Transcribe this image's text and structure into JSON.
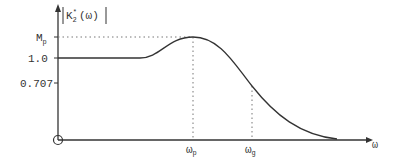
{
  "diagram": {
    "y_axis_label": "K",
    "y_axis_sub": "2",
    "y_axis_sup": "*",
    "y_axis_arg": "(ω)",
    "x_axis_label": "ω",
    "ticks_y": [
      "M",
      "1.0",
      "0.707"
    ],
    "mp_sub": "p",
    "ticks_x": [
      {
        "main": "ω",
        "sub": "p"
      },
      {
        "main": "ω",
        "sub": "g"
      }
    ],
    "colors": {
      "line": "#333333",
      "dotted": "#777777"
    }
  }
}
